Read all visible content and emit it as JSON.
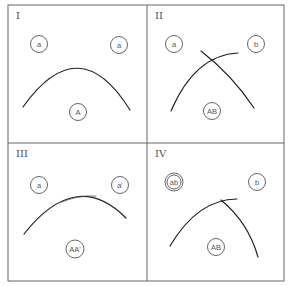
{
  "figure": {
    "panels": [
      {
        "id": "I",
        "label": "I",
        "nodes": [
          {
            "label": "a",
            "style": "single"
          },
          {
            "label": "a",
            "style": "single"
          },
          {
            "label": "A",
            "style": "single"
          }
        ]
      },
      {
        "id": "II",
        "label": "II",
        "nodes": [
          {
            "label": "a",
            "style": "single"
          },
          {
            "label": "b",
            "style": "single"
          },
          {
            "label": "AB",
            "style": "single"
          }
        ]
      },
      {
        "id": "III",
        "label": "III",
        "nodes": [
          {
            "label": "a",
            "style": "single"
          },
          {
            "label": "a'",
            "style": "single"
          },
          {
            "label": "AA'",
            "style": "single"
          }
        ]
      },
      {
        "id": "IV",
        "label": "IV",
        "nodes": [
          {
            "label": "ab",
            "style": "double"
          },
          {
            "label": "b",
            "style": "single"
          },
          {
            "label": "AB",
            "style": "single"
          }
        ]
      }
    ]
  }
}
